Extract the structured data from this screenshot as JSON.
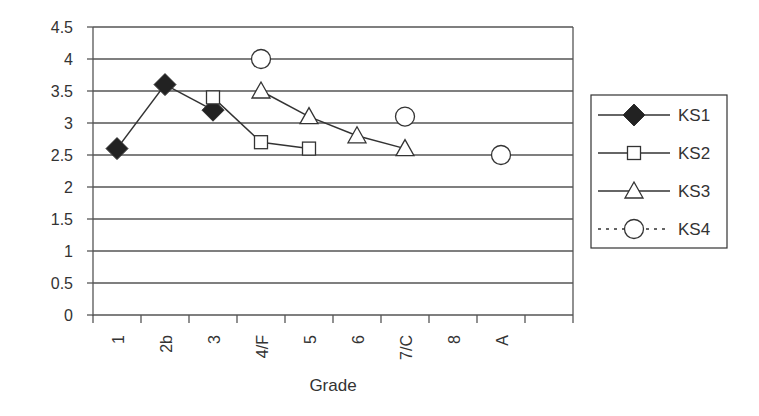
{
  "chart_data": {
    "type": "line",
    "title": "",
    "xlabel": "Grade",
    "ylabel": "",
    "categories": [
      "1",
      "2b",
      "3",
      "4/F",
      "5",
      "6",
      "7/C",
      "8",
      "A",
      ""
    ],
    "ylim": [
      0,
      4.5
    ],
    "yticks": [
      0,
      0.5,
      1,
      1.5,
      2,
      2.5,
      3,
      3.5,
      4,
      4.5
    ],
    "ytick_labels": [
      "0",
      "0.5",
      "1",
      "1.5",
      "2",
      "2.5",
      "3",
      "3.5",
      "4",
      "4.5"
    ],
    "grid": "horizontal",
    "legend_position": "right",
    "series": [
      {
        "name": "KS1",
        "marker": "filled-diamond",
        "line": "solid",
        "values": [
          2.6,
          3.6,
          3.2,
          null,
          null,
          null,
          null,
          null,
          null,
          null
        ]
      },
      {
        "name": "KS2",
        "marker": "open-square",
        "line": "solid",
        "values": [
          null,
          null,
          3.4,
          2.7,
          2.6,
          null,
          null,
          null,
          null,
          null
        ]
      },
      {
        "name": "KS3",
        "marker": "open-triangle",
        "line": "solid",
        "values": [
          null,
          null,
          null,
          3.5,
          3.1,
          2.8,
          2.6,
          null,
          null,
          null
        ]
      },
      {
        "name": "KS4",
        "marker": "open-circle",
        "line": "dotted",
        "values": [
          null,
          null,
          null,
          4.0,
          null,
          null,
          3.1,
          null,
          2.5,
          null
        ]
      }
    ]
  },
  "legend": {
    "items": [
      {
        "label": "KS1"
      },
      {
        "label": "KS2"
      },
      {
        "label": "KS3"
      },
      {
        "label": "KS4"
      }
    ]
  },
  "colors": {
    "line": "#333333",
    "marker_fill": "#222222",
    "grid": "#555555",
    "background": "#ffffff"
  }
}
